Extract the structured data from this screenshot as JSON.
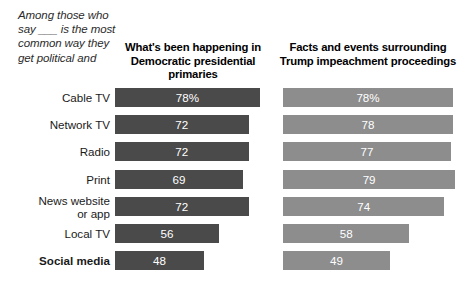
{
  "intro_note": "Among those who say ___ is the most common way they get political and",
  "columns": [
    {
      "id": "col1",
      "header": "What's been happening in Democratic presidential primaries",
      "color": "#4a4a4a"
    },
    {
      "id": "col2",
      "header": "Facts and events surrounding Trump impeachment proceedings",
      "color": "#8d8d8d"
    }
  ],
  "rows": [
    {
      "label": "Cable TV",
      "col1": "78%",
      "col2": "78%",
      "emphasis": false,
      "lines": 1
    },
    {
      "label": "Network TV",
      "col1": "72",
      "col2": "78",
      "emphasis": false,
      "lines": 1
    },
    {
      "label": "Radio",
      "col1": "72",
      "col2": "77",
      "emphasis": false,
      "lines": 1
    },
    {
      "label": "Print",
      "col1": "69",
      "col2": "79",
      "emphasis": false,
      "lines": 1
    },
    {
      "label": "News website\nor app",
      "col1": "72",
      "col2": "74",
      "emphasis": false,
      "lines": 2
    },
    {
      "label": "Local TV",
      "col1": "56",
      "col2": "58",
      "emphasis": false,
      "lines": 1
    },
    {
      "label": "Social media",
      "col1": "48",
      "col2": "49",
      "emphasis": true,
      "lines": 1
    }
  ],
  "chart_data": {
    "type": "bar",
    "title": "",
    "subtitle": "",
    "xlabel": "",
    "ylabel": "",
    "orientation": "horizontal",
    "grid": false,
    "legend": "none",
    "axis_note": "Among those who say ___ is the most common way they get political and",
    "categories": [
      "Cable TV",
      "Network TV",
      "Radio",
      "Print",
      "News website or app",
      "Local TV",
      "Social media"
    ],
    "series": [
      {
        "name": "What's been happening in Democratic presidential primaries",
        "color": "#4a4a4a",
        "values": [
          78,
          72,
          72,
          69,
          72,
          56,
          48
        ],
        "labels": [
          "78%",
          "72",
          "72",
          "69",
          "72",
          "56",
          "48"
        ]
      },
      {
        "name": "Facts and events surrounding Trump impeachment proceedings",
        "color": "#8d8d8d",
        "values": [
          78,
          78,
          77,
          79,
          74,
          58,
          49
        ],
        "labels": [
          "78%",
          "78",
          "77",
          "79",
          "74",
          "58",
          "49"
        ]
      }
    ],
    "xlim": [
      0,
      100
    ],
    "units": "percent"
  }
}
